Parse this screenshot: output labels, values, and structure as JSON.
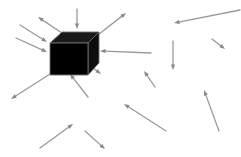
{
  "figure": {
    "background_color": "#ffffff",
    "width": 241,
    "height": 157
  },
  "cube": {
    "label": "black-cube",
    "front_face_color": "#000000",
    "top_face_color": "#1a1a1a",
    "side_face_color": "#0d0d0d",
    "edge_color": "#6f6f6f",
    "front": "50,43 88,43 88,75 50,75",
    "top": "50,43 62,32 99,32 88,43",
    "right": "88,43 99,32 99,63 88,75"
  },
  "arrow_style": {
    "color": "#9a9a9a",
    "color_dark": "#8a8a8a",
    "stroke_width": 1.3,
    "head_length": 5.5,
    "head_width": 4.2
  },
  "arrows": [
    {
      "name": "arrow-out-up-left",
      "x1": 62,
      "y1": 33,
      "x2": 38,
      "y2": 17,
      "direction": "outgoing"
    },
    {
      "name": "arrow-in-top-down",
      "x1": 77,
      "y1": 9,
      "x2": 77,
      "y2": 29,
      "direction": "incoming"
    },
    {
      "name": "arrow-out-up-right",
      "x1": 99,
      "y1": 34,
      "x2": 126,
      "y2": 13,
      "direction": "outgoing"
    },
    {
      "name": "arrow-in-left-upper",
      "x1": 20,
      "y1": 25,
      "x2": 47,
      "y2": 42,
      "direction": "incoming"
    },
    {
      "name": "arrow-in-left-lower",
      "x1": 16,
      "y1": 38,
      "x2": 47,
      "y2": 52,
      "direction": "incoming"
    },
    {
      "name": "arrow-in-right-horizontal",
      "x1": 151,
      "y1": 53,
      "x2": 100,
      "y2": 51,
      "direction": "incoming"
    },
    {
      "name": "arrow-out-down-left",
      "x1": 50,
      "y1": 74,
      "x2": 11,
      "y2": 99,
      "direction": "outgoing"
    },
    {
      "name": "arrow-in-bottom-up-left",
      "x1": 88,
      "y1": 97,
      "x2": 70,
      "y2": 74,
      "direction": "incoming"
    },
    {
      "name": "arrow-out-down-right",
      "x1": 88,
      "y1": 64,
      "x2": 101,
      "y2": 74,
      "direction": "outgoing"
    },
    {
      "name": "arrow-field-top-right-left",
      "x1": 240,
      "y1": 10,
      "x2": 174,
      "y2": 23,
      "direction": "field"
    },
    {
      "name": "arrow-field-small-down-right",
      "x1": 212,
      "y1": 39,
      "x2": 225,
      "y2": 49,
      "direction": "field"
    },
    {
      "name": "arrow-field-vertical-down",
      "x1": 173,
      "y1": 41,
      "x2": 173,
      "y2": 70,
      "direction": "field"
    },
    {
      "name": "arrow-field-mid-up-left",
      "x1": 155,
      "y1": 87,
      "x2": 144,
      "y2": 71,
      "direction": "field"
    },
    {
      "name": "arrow-field-long-up-left",
      "x1": 166,
      "y1": 131,
      "x2": 124,
      "y2": 104,
      "direction": "field"
    },
    {
      "name": "arrow-field-bottom-up-right",
      "x1": 40,
      "y1": 148,
      "x2": 73,
      "y2": 124,
      "direction": "field"
    },
    {
      "name": "arrow-field-bottom-down-right",
      "x1": 85,
      "y1": 131,
      "x2": 105,
      "y2": 149,
      "direction": "field"
    },
    {
      "name": "arrow-field-right-up-left",
      "x1": 219,
      "y1": 131,
      "x2": 204,
      "y2": 90,
      "direction": "field"
    }
  ]
}
